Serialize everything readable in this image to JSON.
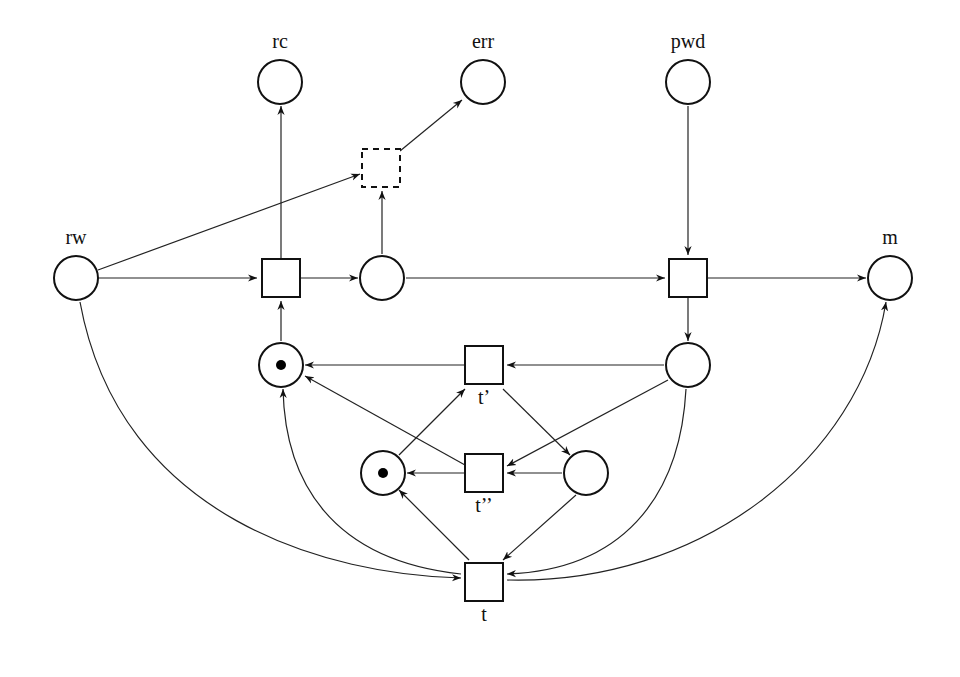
{
  "diagram": {
    "type": "petri-net",
    "places": [
      {
        "id": "rc",
        "label": "rc",
        "x": 280,
        "y": 82,
        "tokens": 0,
        "label_pos": "above"
      },
      {
        "id": "err",
        "label": "err",
        "x": 483,
        "y": 82,
        "tokens": 0,
        "label_pos": "above"
      },
      {
        "id": "pwd",
        "label": "pwd",
        "x": 688,
        "y": 82,
        "tokens": 0,
        "label_pos": "above"
      },
      {
        "id": "rw",
        "label": "rw",
        "x": 76,
        "y": 278,
        "tokens": 0,
        "label_pos": "above"
      },
      {
        "id": "p_mid",
        "label": "",
        "x": 382,
        "y": 278,
        "tokens": 0
      },
      {
        "id": "m",
        "label": "m",
        "x": 890,
        "y": 278,
        "tokens": 0,
        "label_pos": "above"
      },
      {
        "id": "p_lock1",
        "label": "",
        "x": 281,
        "y": 365,
        "tokens": 1
      },
      {
        "id": "p_right",
        "label": "",
        "x": 688,
        "y": 365,
        "tokens": 0
      },
      {
        "id": "p_lock2",
        "label": "",
        "x": 383,
        "y": 473,
        "tokens": 1
      },
      {
        "id": "p_inner",
        "label": "",
        "x": 586,
        "y": 473,
        "tokens": 0
      }
    ],
    "transitions": [
      {
        "id": "t_err",
        "label": "",
        "x": 381,
        "y": 168,
        "dashed": true
      },
      {
        "id": "t_read",
        "label": "",
        "x": 281,
        "y": 278,
        "dashed": false
      },
      {
        "id": "t_write",
        "label": "",
        "x": 688,
        "y": 278,
        "dashed": false
      },
      {
        "id": "t1",
        "label": "t’",
        "x": 484,
        "y": 365,
        "dashed": false,
        "label_pos": "below"
      },
      {
        "id": "t2",
        "label": "t’’",
        "x": 484,
        "y": 473,
        "dashed": false,
        "label_pos": "below"
      },
      {
        "id": "t",
        "label": "t",
        "x": 484,
        "y": 582,
        "dashed": false,
        "label_pos": "below"
      }
    ],
    "arcs": [
      {
        "from": "rw",
        "to": "t_read",
        "d": "M98,278 L257,278"
      },
      {
        "from": "rw",
        "to": "t_err",
        "d": "M98,270 L360,174"
      },
      {
        "from": "t_read",
        "to": "rc",
        "d": "M281,259 L281,106"
      },
      {
        "from": "t_read",
        "to": "p_mid",
        "d": "M300,278 L358,278"
      },
      {
        "from": "p_mid",
        "to": "t_err",
        "d": "M382,254 L382,191"
      },
      {
        "from": "t_err",
        "to": "err",
        "d": "M400,151 L462,100"
      },
      {
        "from": "p_mid",
        "to": "t_write",
        "d": "M406,278 L665,278"
      },
      {
        "from": "pwd",
        "to": "t_write",
        "d": "M688,106 L688,255"
      },
      {
        "from": "t_write",
        "to": "m",
        "d": "M707,278 L866,278"
      },
      {
        "from": "t_write",
        "to": "p_right",
        "d": "M688,297 L688,341"
      },
      {
        "from": "p_lock1",
        "to": "t_read",
        "d": "M281,341 L281,301"
      },
      {
        "from": "p_right",
        "to": "t1",
        "d": "M664,365 L507,365"
      },
      {
        "from": "t1",
        "to": "p_lock1",
        "d": "M465,365 L305,365"
      },
      {
        "from": "p_lock2",
        "to": "t1",
        "d": "M399,455 L465,389"
      },
      {
        "from": "t1",
        "to": "p_inner",
        "d": "M503,389 L570,455"
      },
      {
        "from": "p_right",
        "to": "t2",
        "d": "M668,380 L507,466"
      },
      {
        "from": "p_inner",
        "to": "t2",
        "d": "M562,473 L507,473"
      },
      {
        "from": "t2",
        "to": "p_lock2",
        "d": "M465,473 L407,473"
      },
      {
        "from": "t2",
        "to": "p_lock1",
        "d": "M465,465 L305,376"
      },
      {
        "from": "rw",
        "to": "t",
        "d": "M80,302 C120,520 330,575 461,578"
      },
      {
        "from": "t",
        "to": "p_lock1",
        "d": "M461,574 C330,560 285,480 283,389"
      },
      {
        "from": "t",
        "to": "p_lock2",
        "d": "M469,560 L399,490"
      },
      {
        "from": "p_inner",
        "to": "t",
        "d": "M576,495 L503,560"
      },
      {
        "from": "p_right",
        "to": "t",
        "d": "M686,389 C680,500 620,570 507,574"
      },
      {
        "from": "t",
        "to": "m",
        "d": "M507,580 C700,585 860,460 886,302"
      }
    ]
  }
}
